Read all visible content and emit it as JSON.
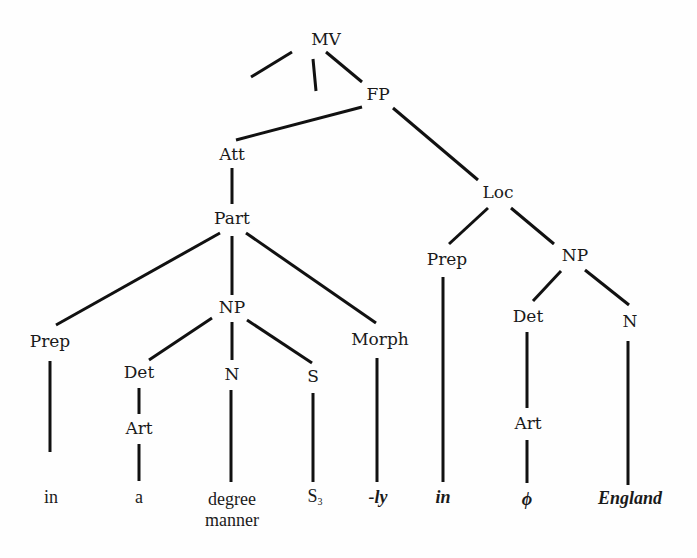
{
  "diagram": {
    "type": "syntax-tree",
    "nodes": {
      "mv": "MV",
      "fp": "FP",
      "att": "Att",
      "part": "Part",
      "loc": "Loc",
      "prep_left": "Prep",
      "np_mid": "NP",
      "morph": "Morph",
      "det_left": "Det",
      "n_mid": "N",
      "s_mid": "S",
      "art_left": "Art",
      "prep_right": "Prep",
      "np_right": "NP",
      "det_right": "Det",
      "n_right": "N",
      "art_right": "Art"
    },
    "leaves": {
      "in_1": "in",
      "a": "a",
      "degree": "degree",
      "manner": "manner",
      "s3_base": "S",
      "s3_sub": "3",
      "ly": "-ly",
      "in_2": "in",
      "phi": "ϕ",
      "england": "England"
    },
    "edges": [
      [
        "MV",
        "(left branch)"
      ],
      [
        "MV",
        "(middle branch)"
      ],
      [
        "MV",
        "FP"
      ],
      [
        "FP",
        "Att"
      ],
      [
        "FP",
        "Loc"
      ],
      [
        "Att",
        "Part"
      ],
      [
        "Part",
        "Prep"
      ],
      [
        "Part",
        "NP"
      ],
      [
        "Part",
        "Morph"
      ],
      [
        "Prep",
        "in"
      ],
      [
        "NP",
        "Det"
      ],
      [
        "NP",
        "N"
      ],
      [
        "NP",
        "S"
      ],
      [
        "Det",
        "Art"
      ],
      [
        "Art",
        "a"
      ],
      [
        "N",
        "degree manner"
      ],
      [
        "S",
        "S3"
      ],
      [
        "Morph",
        "-ly"
      ],
      [
        "Loc",
        "Prep"
      ],
      [
        "Loc",
        "NP"
      ],
      [
        "Prep",
        "in"
      ],
      [
        "NP",
        "Det"
      ],
      [
        "NP",
        "N"
      ],
      [
        "Det",
        "Art"
      ],
      [
        "Art",
        "ϕ"
      ],
      [
        "N",
        "England"
      ]
    ]
  }
}
